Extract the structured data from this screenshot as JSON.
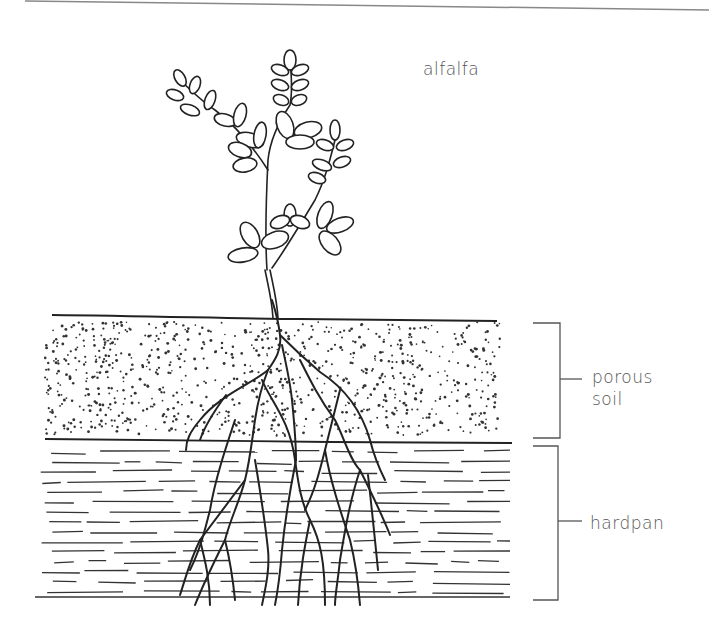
{
  "diagram": {
    "plant_label": "alfalfa",
    "layers": [
      {
        "id": "porous-soil",
        "label_line1": "porous",
        "label_line2": "soil",
        "pattern": "stippled dots"
      },
      {
        "id": "hardpan",
        "label_line1": "hardpan",
        "label_line2": "",
        "pattern": "horizontal dashes"
      }
    ],
    "colors": {
      "ink": "#222222",
      "label": "#555555",
      "bracket": "#555555",
      "background": "#ffffff"
    }
  }
}
